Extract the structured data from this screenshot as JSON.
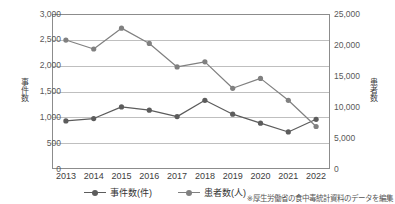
{
  "footnote": "※厚生労働省の食中毒統計資料のデータを編集",
  "colors": {
    "series_jiken": "#5c5c5c",
    "series_kanja": "#808080",
    "grid": "#bfbfbf",
    "axis": "#8c8c8c"
  },
  "chart_data": {
    "type": "line",
    "title": "",
    "xlabel": "",
    "categories": [
      "2013",
      "2014",
      "2015",
      "2016",
      "2017",
      "2018",
      "2019",
      "2020",
      "2021",
      "2022"
    ],
    "grid": true,
    "legend_position": "bottom",
    "axes": {
      "left": {
        "label": "事件数",
        "ylim": [
          0,
          3000
        ],
        "ticks": [
          0,
          500,
          1000,
          1500,
          2000,
          2500,
          3000
        ],
        "ticklabels": [
          "0",
          "500",
          "1,000",
          "1,500",
          "2,000",
          "2,500",
          "3,000"
        ]
      },
      "right": {
        "label": "患者数",
        "ylim": [
          0,
          25000
        ],
        "ticks": [
          0,
          5000,
          10000,
          15000,
          20000,
          25000
        ],
        "ticklabels": [
          "0",
          "5,000",
          "10,000",
          "15,000",
          "20,000",
          "25,000"
        ]
      }
    },
    "series": [
      {
        "name": "事件数(件)",
        "legend_label": "事件数(件)",
        "axis": "left",
        "values": [
          931,
          976,
          1202,
          1139,
          1014,
          1330,
          1061,
          887,
          717,
          962
        ]
      },
      {
        "name": "患者数(人)",
        "legend_label": "患者数(人)",
        "axis": "right",
        "values": [
          20802,
          19355,
          22718,
          20252,
          16464,
          17282,
          13018,
          14613,
          11080,
          6856
        ]
      }
    ]
  }
}
